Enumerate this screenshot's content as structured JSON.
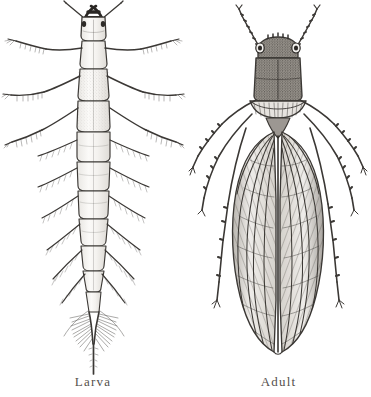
{
  "plate": {
    "background_color": "#ffffff",
    "ink_color": "#3b3835",
    "width": 371,
    "height": 397,
    "figure_count": 2
  },
  "figures": [
    {
      "id": "larva",
      "caption": "Larva",
      "icon_name": "insect-larva-illustration",
      "description": "Dorsal view engraving of an aquatic insect larva",
      "orientation": "dorsal, head at top",
      "parts": [
        "mandibles",
        "antennae",
        "compound-eyes",
        "head-capsule",
        "prothorax",
        "mesothorax",
        "metathorax",
        "three-pairs-of-legs",
        "abdominal-segments",
        "lateral-gill-filaments",
        "terminal-filament"
      ],
      "segment_count": 9,
      "leg_pairs": 3,
      "gill_pairs": 7
    },
    {
      "id": "adult",
      "caption": "Adult",
      "icon_name": "insect-adult-illustration",
      "description": "Dorsal view engraving of the winged adult insect",
      "orientation": "dorsal, head at top",
      "parts": [
        "antennae",
        "compound-eyes",
        "head",
        "pronotum",
        "mesonotum",
        "folded-forewings",
        "wing-venation",
        "three-pairs-of-legs"
      ],
      "wing_count": 2,
      "leg_pairs": 3
    }
  ],
  "captions": {
    "larva": "Larva",
    "adult": "Adult",
    "color": "#54504c"
  }
}
